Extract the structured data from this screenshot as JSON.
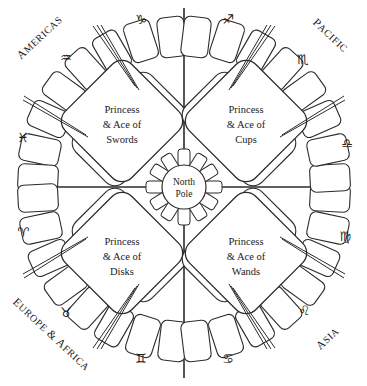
{
  "diagram": {
    "center": {
      "name": "hub",
      "line1": "North",
      "line2": "Pole"
    },
    "quadrants": [
      {
        "id": "swords",
        "line1": "Princess",
        "line2": "& Ace of",
        "line3": "Swords",
        "position": "top-left"
      },
      {
        "id": "cups",
        "line1": "Princess",
        "line2": "& Ace of",
        "line3": "Cups",
        "position": "top-right"
      },
      {
        "id": "disks",
        "line1": "Princess",
        "line2": "& Ace of",
        "line3": "Disks",
        "position": "bottom-left"
      },
      {
        "id": "wands",
        "line1": "Princess",
        "line2": "& Ace of",
        "line3": "Wands",
        "position": "bottom-right"
      }
    ],
    "regions": [
      {
        "id": "americas",
        "label": "Americas",
        "position": "top-left"
      },
      {
        "id": "pacific",
        "label": "Pacific",
        "position": "top-right"
      },
      {
        "id": "europe-africa",
        "label": "Europe & Africa",
        "position": "bottom-left"
      },
      {
        "id": "asia",
        "label": "Asia",
        "position": "bottom-right"
      }
    ],
    "zodiac": [
      {
        "id": "capricorn",
        "name": "capricorn",
        "glyph": "♑"
      },
      {
        "id": "sagittarius",
        "name": "sagittarius",
        "glyph": "♐"
      },
      {
        "id": "aquarius",
        "name": "aquarius",
        "glyph": "♒"
      },
      {
        "id": "scorpio",
        "name": "scorpio",
        "glyph": "♏"
      },
      {
        "id": "pisces",
        "name": "pisces",
        "glyph": "♓"
      },
      {
        "id": "libra",
        "name": "libra",
        "glyph": "♎"
      },
      {
        "id": "aries",
        "name": "aries",
        "glyph": "♈"
      },
      {
        "id": "virgo",
        "name": "virgo",
        "glyph": "♍"
      },
      {
        "id": "taurus",
        "name": "taurus",
        "glyph": "♉"
      },
      {
        "id": "leo",
        "name": "leo",
        "glyph": "♌"
      },
      {
        "id": "gemini",
        "name": "gemini",
        "glyph": "♊"
      },
      {
        "id": "cancer",
        "name": "cancer",
        "glyph": "♋"
      }
    ],
    "colors": {
      "ink": "#2b2b2b",
      "paper": "#ffffff"
    }
  }
}
